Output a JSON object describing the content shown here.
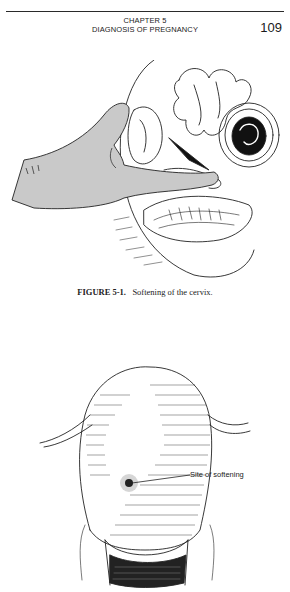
{
  "header": {
    "chapter_line": "CHAPTER 5",
    "chapter_title": "DIAGNOSIS OF PREGNANCY",
    "page_number": "109"
  },
  "figure1": {
    "illustration": "hand-examining-cervix-illustration",
    "caption_label": "FIGURE 5-1.",
    "caption_text": "Softening of the cervix."
  },
  "figure2": {
    "illustration": "uterus-anterior-view-illustration",
    "annotation": "Site of softening"
  }
}
